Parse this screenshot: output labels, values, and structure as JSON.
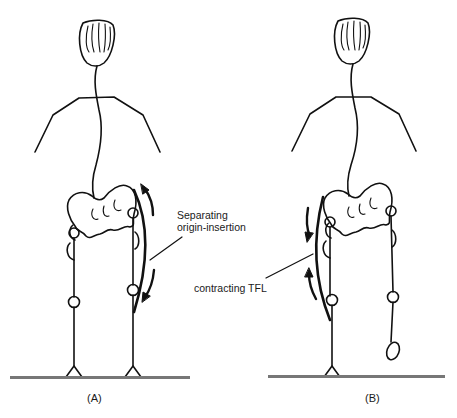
{
  "figure": {
    "panels": [
      {
        "id": "A",
        "caption": "(A)",
        "annotation_lines": [
          "Separating",
          "origin-insertion"
        ]
      },
      {
        "id": "B",
        "caption": "(B)",
        "annotation_lines": [
          "contracting TFL"
        ]
      }
    ],
    "colors": {
      "stroke": "#111111",
      "ground": "#777777",
      "background": "#ffffff"
    }
  }
}
